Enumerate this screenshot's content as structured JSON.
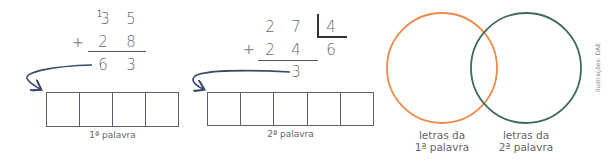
{
  "problem1": {
    "carry": "1",
    "row1": [
      "3",
      "5"
    ],
    "sign": "+",
    "row2": [
      "2",
      "8"
    ],
    "result": [
      "6",
      "3"
    ],
    "word_label": "1ª palavra",
    "cells": 4
  },
  "problem2": {
    "dividend": [
      "2",
      "7"
    ],
    "divisor": "4",
    "sign": "+",
    "row2": [
      "2",
      "4"
    ],
    "quotient": "6",
    "remainder": "3",
    "word_label": "2ª palavra",
    "cells": 5
  },
  "venn": {
    "left_label_line1": "letras da",
    "left_label_line2": "1ª palavra",
    "right_label_line1": "letras da",
    "right_label_line2": "2ª palavra",
    "left_color": "#f08a4b",
    "right_color": "#3d6b58"
  },
  "credit": "Ilustrações: DAE",
  "colors": {
    "arrow": "#3a4a6b",
    "box_border": "#5a6270",
    "text": "#6a6a6a"
  }
}
